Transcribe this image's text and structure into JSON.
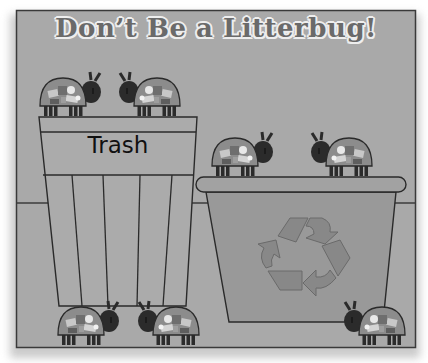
{
  "title": "Don’t Be a Litterbug!",
  "trash_can": {
    "label": "Trash"
  },
  "recycling_bin": {
    "icon": "recycle-icon"
  },
  "colors": {
    "background": "#a9a9a9",
    "title_text": "#6a6a6a",
    "title_outline": "#eeeeee",
    "outline": "#2a2a2a",
    "recycle_bin_fill": "#9a9a9a",
    "recycle_symbol": "#8a8a8a",
    "bug_head": "#2b2b2b",
    "bug_shell": "#8c8c8c"
  },
  "bugs": [
    {
      "id": 1,
      "location": "on-trash-can",
      "facing": "right"
    },
    {
      "id": 2,
      "location": "on-trash-can",
      "facing": "left"
    },
    {
      "id": 3,
      "location": "on-recycling-bin",
      "facing": "right"
    },
    {
      "id": 4,
      "location": "on-recycling-bin",
      "facing": "left"
    },
    {
      "id": 5,
      "location": "floor",
      "facing": "right"
    },
    {
      "id": 6,
      "location": "floor",
      "facing": "left"
    },
    {
      "id": 7,
      "location": "floor",
      "facing": "left"
    }
  ]
}
